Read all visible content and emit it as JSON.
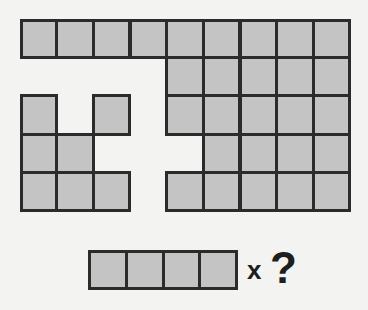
{
  "puzzle": {
    "grid": {
      "rows": 5,
      "cols": 9,
      "fill_color": "#c4c4c4",
      "line_color": "#2b2b2b",
      "cells": [
        [
          1,
          1,
          1,
          1,
          1,
          1,
          1,
          1,
          1
        ],
        [
          0,
          0,
          0,
          0,
          1,
          1,
          1,
          1,
          1
        ],
        [
          1,
          0,
          1,
          0,
          1,
          1,
          1,
          1,
          1
        ],
        [
          1,
          1,
          0,
          0,
          0,
          1,
          1,
          1,
          1
        ],
        [
          1,
          1,
          1,
          0,
          1,
          1,
          1,
          1,
          1
        ]
      ]
    },
    "piece": {
      "length": 4
    },
    "operator": "x",
    "question": "?"
  }
}
